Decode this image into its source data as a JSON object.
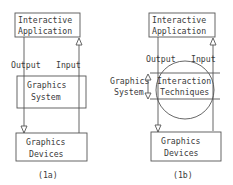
{
  "diagram_a": {
    "caption": "(1a)",
    "top_box": {
      "line1": "Interactive",
      "line2": "Application"
    },
    "middle_box": {
      "line1": "Graphics",
      "line2": "System"
    },
    "bottom_box": {
      "line1": "Graphics",
      "line2": "Devices"
    },
    "output_label": "Output",
    "input_label": "Input"
  },
  "diagram_b": {
    "caption": "(1b)",
    "top_box": {
      "line1": "Interactive",
      "line2": "Application"
    },
    "middle_band": {
      "line1": "Interaction",
      "line2": "Techniques"
    },
    "side_label": {
      "line1": "Graphics",
      "line2": "System"
    },
    "bottom_box": {
      "line1": "Graphics",
      "line2": "Devices"
    },
    "output_label": "Output",
    "input_label": "Input"
  },
  "colors": {
    "stroke": "#555555",
    "text": "#3a3a3a",
    "background": "#ffffff"
  }
}
